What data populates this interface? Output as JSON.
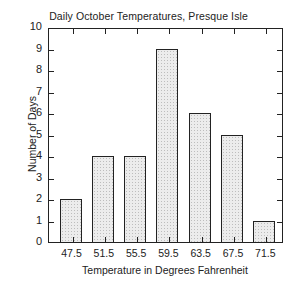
{
  "chart_data": {
    "type": "bar",
    "title": "Daily October Temperatures, Presque Isle",
    "xlabel": "Temperature in Degrees Fahrenheit",
    "ylabel": "Number of Days",
    "categories": [
      "47.5",
      "51.5",
      "55.5",
      "59.5",
      "63.5",
      "67.5",
      "71.5"
    ],
    "values": [
      2,
      4,
      4,
      9,
      6,
      5,
      1
    ],
    "ylim": [
      0,
      10
    ],
    "yticks": [
      "0",
      "1",
      "2",
      "3",
      "4",
      "5",
      "6",
      "7",
      "8",
      "9",
      "10"
    ],
    "grid": false,
    "legend": null
  }
}
